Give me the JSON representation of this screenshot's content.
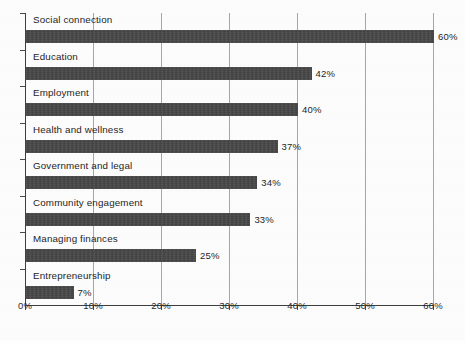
{
  "chart_data": {
    "type": "bar",
    "orientation": "horizontal",
    "title": "",
    "xlabel": "",
    "ylabel": "",
    "categories": [
      "Social connection",
      "Education",
      "Employment",
      "Health and wellness",
      "Government and legal",
      "Community engagement",
      "Managing finances",
      "Entrepreneurship"
    ],
    "values": [
      60,
      42,
      40,
      37,
      34,
      33,
      25,
      7
    ],
    "value_labels": [
      "60%",
      "42%",
      "40%",
      "37%",
      "34%",
      "33%",
      "25%",
      "7%"
    ],
    "xlim": [
      0,
      60
    ],
    "xticks": [
      0,
      10,
      20,
      30,
      40,
      50,
      60
    ],
    "xtick_labels": [
      "0%",
      "10%",
      "20%",
      "30%",
      "40%",
      "50%",
      "60%"
    ],
    "grid": true,
    "grid_axis": "x",
    "legend": null,
    "bar_color": "#3b3b3b",
    "background_color": "#fdfdfd",
    "axis_color": "#3e3e3e",
    "gridline_color": "#a7a7a7"
  }
}
